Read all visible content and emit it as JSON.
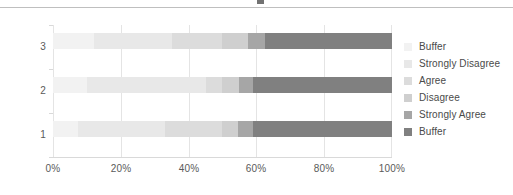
{
  "chart_data": {
    "type": "bar",
    "orientation": "horizontal",
    "stacked": true,
    "normalized": true,
    "title": "",
    "subtitle": "",
    "xlabel": "",
    "ylabel": "",
    "categories": [
      "1",
      "2",
      "3"
    ],
    "category_order_top_to_bottom": [
      "3",
      "2",
      "1"
    ],
    "xlim": [
      0,
      100
    ],
    "xticks": [
      0,
      20,
      40,
      60,
      80,
      100
    ],
    "xtick_labels": [
      "0%",
      "20%",
      "40%",
      "60%",
      "80%",
      "100%"
    ],
    "grid": true,
    "grid_axis": "x",
    "legend_position": "right",
    "legend_entries": [
      "Buffer",
      "Strongly Disagree",
      "Agree",
      "Disagree",
      "Strongly Agree",
      "Buffer"
    ],
    "series": [
      {
        "name": "Buffer",
        "color": "#f2f2f2",
        "values": [
          7.5,
          10.0,
          12.0
        ]
      },
      {
        "name": "Strongly Disagree",
        "color": "#e8e8e8",
        "values": [
          25.5,
          35.0,
          23.0
        ]
      },
      {
        "name": "Agree",
        "color": "#dcdcdc",
        "values": [
          17.0,
          5.0,
          15.0
        ]
      },
      {
        "name": "Disagree",
        "color": "#cfcfcf",
        "values": [
          4.5,
          5.0,
          7.5
        ]
      },
      {
        "name": "Strongly Agree",
        "color": "#a6a6a6",
        "values": [
          4.5,
          4.0,
          5.0
        ]
      },
      {
        "name": "Buffer",
        "color": "#808080",
        "values": [
          41.0,
          41.0,
          37.5
        ]
      }
    ]
  },
  "axis": {
    "x_tick_labels": [
      "0%",
      "20%",
      "40%",
      "60%",
      "80%",
      "100%"
    ],
    "y_tick_labels_top_to_bottom": [
      "3",
      "2",
      "1"
    ]
  },
  "legend": {
    "items": [
      {
        "label": "Buffer",
        "color": "#f2f2f2"
      },
      {
        "label": "Strongly Disagree",
        "color": "#e8e8e8"
      },
      {
        "label": "Agree",
        "color": "#dcdcdc"
      },
      {
        "label": "Disagree",
        "color": "#cfcfcf"
      },
      {
        "label": "Strongly Agree",
        "color": "#a6a6a6"
      },
      {
        "label": "Buffer",
        "color": "#808080"
      }
    ]
  },
  "colors": {
    "background": "#ffffff",
    "gridline": "#e4e4e4",
    "axis_line": "#d9d9d9",
    "tick_text": "#5a5a5a",
    "legend_text": "#4a4a4a",
    "top_rule": "#bfbfbf"
  }
}
